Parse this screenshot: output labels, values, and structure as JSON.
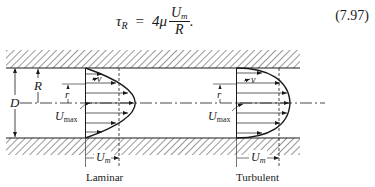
{
  "equation": {
    "lhs_symbol": "τ",
    "lhs_subscript": "R",
    "equals": "=",
    "coefficient": "4μ",
    "numerator": "U",
    "numerator_subscript": "m",
    "denominator": "R",
    "trailing": ".",
    "number": "(7.97)"
  },
  "diagram": {
    "labels": {
      "radius": "R",
      "diameter": "D",
      "local_radius": "r",
      "velocity": "v",
      "umax": "U",
      "umax_sub": "max",
      "um": "U",
      "um_sub": "m"
    },
    "profiles": [
      {
        "name": "Laminar",
        "shape": "parabolic"
      },
      {
        "name": "Turbulent",
        "shape": "blunt"
      }
    ],
    "colors": {
      "ink": "#1a1a1a",
      "background": "#ffffff"
    }
  }
}
